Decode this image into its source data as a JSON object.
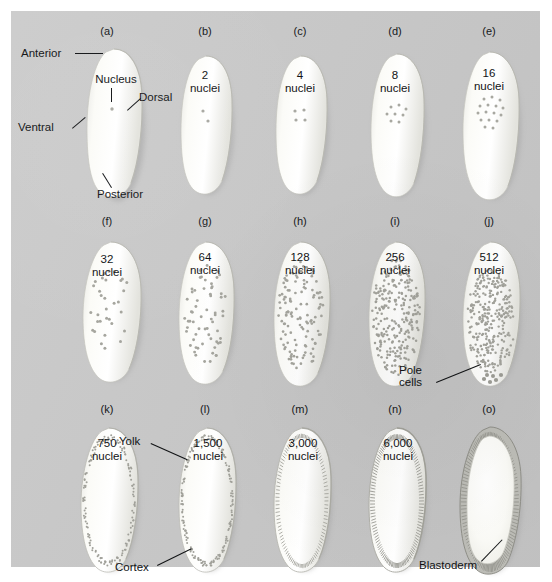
{
  "figure": {
    "background_color": "#c9c9c9",
    "text_color": "#111315",
    "embryo_fill": "#fbfbf8",
    "embryo_shadow": "#9d9d9d"
  },
  "rows": [
    {
      "panels": [
        {
          "letter": "(a)",
          "count_line1": "",
          "count_line2": "",
          "nuclei": 1,
          "stage": "single nucleus",
          "annotations": [
            {
              "text": "Anterior",
              "position": "upper-left"
            },
            {
              "text": "Nucleus",
              "position": "top-center-inside"
            },
            {
              "text": "Dorsal",
              "position": "middle-right"
            },
            {
              "text": "Ventral",
              "position": "middle-left"
            },
            {
              "text": "Posterior",
              "position": "bottom-right"
            }
          ]
        },
        {
          "letter": "(b)",
          "count_line1": "2",
          "count_line2": "nuclei",
          "nuclei": 2,
          "stage": "cleavage",
          "annotations": []
        },
        {
          "letter": "(c)",
          "count_line1": "4",
          "count_line2": "nuclei",
          "nuclei": 4,
          "stage": "cleavage",
          "annotations": []
        },
        {
          "letter": "(d)",
          "count_line1": "8",
          "count_line2": "nuclei",
          "nuclei": 8,
          "stage": "cleavage",
          "annotations": []
        },
        {
          "letter": "(e)",
          "count_line1": "16",
          "count_line2": "nuclei",
          "nuclei": 16,
          "stage": "cleavage",
          "annotations": []
        }
      ]
    },
    {
      "panels": [
        {
          "letter": "(f)",
          "count_line1": "32",
          "count_line2": "nuclei",
          "nuclei": 32,
          "stage": "syncytial",
          "annotations": []
        },
        {
          "letter": "(g)",
          "count_line1": "64",
          "count_line2": "nuclei",
          "nuclei": 64,
          "stage": "syncytial",
          "annotations": []
        },
        {
          "letter": "(h)",
          "count_line1": "128",
          "count_line2": "nuclei",
          "nuclei": 128,
          "stage": "syncytial",
          "annotations": []
        },
        {
          "letter": "(i)",
          "count_line1": "256",
          "count_line2": "nuclei",
          "nuclei": 256,
          "stage": "syncytial",
          "annotations": []
        },
        {
          "letter": "(j)",
          "count_line1": "512",
          "count_line2": "nuclei",
          "nuclei": 512,
          "stage": "syncytial blastoderm",
          "annotations": [
            {
              "text_line1": "Pole",
              "text_line2": "cells",
              "position": "bottom-left-leader"
            }
          ]
        }
      ]
    },
    {
      "panels": [
        {
          "letter": "(k)",
          "count_line1": "750",
          "count_line2": "nuclei",
          "nuclei": 750,
          "stage": "syncytial blastoderm",
          "annotations": []
        },
        {
          "letter": "(l)",
          "count_line1": "1,500",
          "count_line2": "nuclei",
          "nuclei": 1500,
          "stage": "syncytial blastoderm",
          "annotations": [
            {
              "text": "Yolk",
              "position": "upper-left-leader"
            },
            {
              "text": "Cortex",
              "position": "lower-left-leader"
            }
          ]
        },
        {
          "letter": "(m)",
          "count_line1": "3,000",
          "count_line2": "nuclei",
          "nuclei": 3000,
          "stage": "syncytial blastoderm",
          "annotations": []
        },
        {
          "letter": "(n)",
          "count_line1": "6,000",
          "count_line2": "nuclei",
          "nuclei": 6000,
          "stage": "cellularization",
          "annotations": []
        },
        {
          "letter": "(o)",
          "count_line1": "",
          "count_line2": "",
          "nuclei": 6000,
          "stage": "cellular blastoderm",
          "annotations": [
            {
              "text": "Blastoderm",
              "position": "bottom-leader"
            }
          ]
        }
      ]
    }
  ],
  "labels": {
    "anterior": "Anterior",
    "posterior": "Posterior",
    "dorsal": "Dorsal",
    "ventral": "Ventral",
    "nucleus": "Nucleus",
    "pole_cells_line1": "Pole",
    "pole_cells_line2": "cells",
    "yolk": "Yolk",
    "cortex": "Cortex",
    "blastoderm": "Blastoderm"
  },
  "panel_letters": {
    "a": "(a)",
    "b": "(b)",
    "c": "(c)",
    "d": "(d)",
    "e": "(e)",
    "f": "(f)",
    "g": "(g)",
    "h": "(h)",
    "i": "(i)",
    "j": "(j)",
    "k": "(k)",
    "l": "(l)",
    "m": "(m)",
    "n": "(n)",
    "o": "(o)"
  },
  "counts": {
    "b": "2",
    "c": "4",
    "d": "8",
    "e": "16",
    "f": "32",
    "g": "64",
    "h": "128",
    "i": "256",
    "j": "512",
    "k": "750",
    "l": "1,500",
    "m": "3,000",
    "n": "6,000",
    "nuclei_word": "nuclei"
  }
}
